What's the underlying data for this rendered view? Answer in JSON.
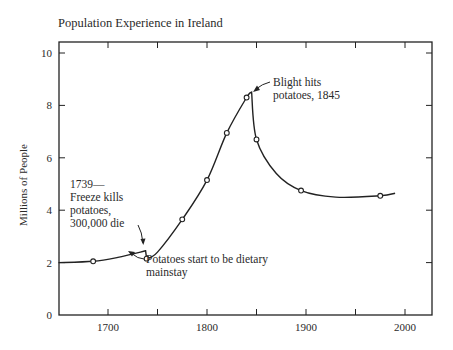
{
  "chart_data": {
    "type": "line",
    "title": "Population Experience in Ireland",
    "xlabel": "",
    "ylabel": "Millions of People",
    "xlim": [
      1650,
      2030
    ],
    "ylim": [
      0,
      10
    ],
    "xticks": [
      1700,
      1800,
      1900,
      2000
    ],
    "xtick_labels": [
      "1700",
      "1800",
      "1900",
      "2000"
    ],
    "yticks": [
      0,
      2,
      4,
      6,
      8,
      10
    ],
    "ytick_labels": [
      "0",
      "2",
      "4",
      "6",
      "8",
      "10"
    ],
    "grid": false,
    "legend": null,
    "series": [
      {
        "name": "Population of Ireland",
        "curve": [
          [
            1650,
            2.0
          ],
          [
            1685,
            2.05
          ],
          [
            1710,
            2.2
          ],
          [
            1738,
            2.45
          ],
          [
            1739,
            2.15
          ],
          [
            1750,
            2.4
          ],
          [
            1775,
            3.65
          ],
          [
            1800,
            5.15
          ],
          [
            1820,
            6.95
          ],
          [
            1840,
            8.3
          ],
          [
            1845,
            8.5
          ],
          [
            1850,
            6.7
          ],
          [
            1870,
            5.4
          ],
          [
            1895,
            4.75
          ],
          [
            1930,
            4.5
          ],
          [
            1975,
            4.55
          ],
          [
            1990,
            4.65
          ]
        ],
        "markers": [
          [
            1685,
            2.05
          ],
          [
            1739,
            2.15
          ],
          [
            1775,
            3.65
          ],
          [
            1800,
            5.15
          ],
          [
            1820,
            6.95
          ],
          [
            1840,
            8.3
          ],
          [
            1850,
            6.7
          ],
          [
            1895,
            4.75
          ],
          [
            1975,
            4.55
          ]
        ]
      }
    ],
    "annotations": [
      {
        "text": [
          "1739—",
          "Freeze kills",
          "potatoes,",
          "300,000 die"
        ],
        "x": 1739,
        "y": 2.45
      },
      {
        "text": [
          "Potatoes start to be dietary",
          "mainstay"
        ],
        "x": 1745,
        "y": 2.2
      },
      {
        "text": [
          "Blight hits",
          "potatoes, 1845"
        ],
        "x": 1845,
        "y": 8.5
      }
    ]
  }
}
